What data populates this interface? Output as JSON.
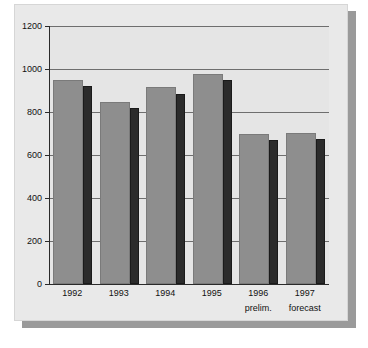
{
  "figure": {
    "background_color": "#e9e9e9",
    "plot_background_color": "#e5e5e5",
    "shadow_color": "#9a9a9a",
    "axis_color": "#2a2a2a",
    "gridline_color": "#6e6e6e"
  },
  "chart_data": {
    "type": "bar",
    "title": "",
    "subtitle": "",
    "xlabel": "",
    "ylabel": "",
    "categories": [
      "1992",
      "1993",
      "1994",
      "1995",
      "1996",
      "1997"
    ],
    "category_sublabels": [
      "",
      "",
      "",
      "",
      "prelim.",
      "forecast"
    ],
    "series": [
      {
        "name": "primary",
        "color": "#8e8e8e",
        "values": [
          950,
          845,
          915,
          975,
          700,
          702
        ]
      },
      {
        "name": "secondary",
        "color": "#2b2b2b",
        "values": [
          920,
          818,
          883,
          950,
          672,
          675
        ]
      }
    ],
    "ylim": [
      0,
      1200
    ],
    "yticks": [
      0,
      200,
      400,
      600,
      800,
      1000,
      1200
    ],
    "ytick_labels": [
      "0",
      "200",
      "400",
      "600",
      "800",
      "1000",
      "1200"
    ],
    "grid": true,
    "grid_axis": "y",
    "legend": "none",
    "legend_position": "none"
  }
}
